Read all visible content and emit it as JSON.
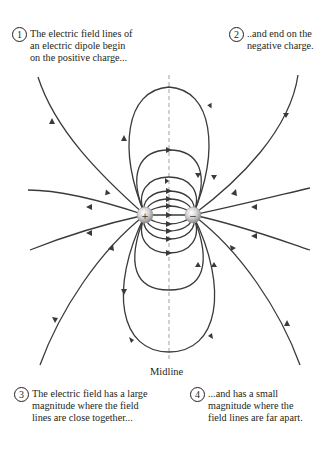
{
  "diagram": {
    "title": "Electric field lines of an electric dipole",
    "annotations": [
      {
        "number": "1",
        "text": "The electric field lines of\nan electric dipole begin\non the positive charge..."
      },
      {
        "number": "2",
        "text": "..and end on the\nnegative charge."
      },
      {
        "number": "3",
        "text": "The electric field has a large\nmagnitude where the field\nlines are close together..."
      },
      {
        "number": "4",
        "text": "...and has a small\nmagnitude where the\nfield lines are far apart."
      }
    ],
    "midline_label": "Midline",
    "charges": [
      {
        "sign": "+",
        "label": "positive charge",
        "x": 145,
        "y": 215
      },
      {
        "sign": "−",
        "label": "negative charge",
        "x": 193,
        "y": 215
      }
    ],
    "colors": {
      "field_line": "#3a3a3a",
      "midline": "#8a8a8a",
      "charge_fill": "#c8c8c8",
      "text": "#231f20"
    }
  }
}
